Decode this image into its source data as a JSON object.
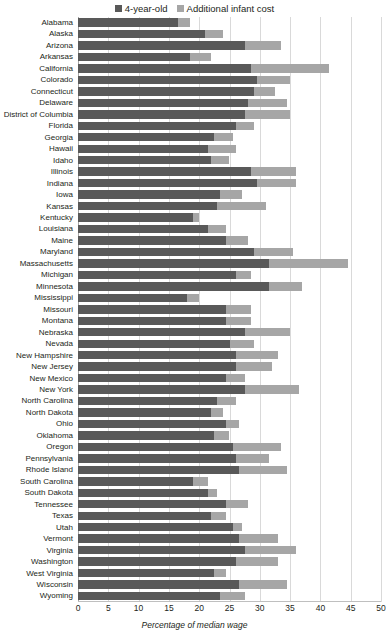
{
  "legend": {
    "items": [
      {
        "label": "4-year-old",
        "color": "#595959",
        "icon": "square-swatch-icon"
      },
      {
        "label": "Additional infant cost",
        "color": "#a6a6a6",
        "icon": "square-swatch-icon"
      }
    ]
  },
  "axis": {
    "xlabel": "Percentage of median wage",
    "ticks": [
      "0",
      "5",
      "10",
      "15",
      "20",
      "25",
      "30",
      "35",
      "40",
      "45",
      "50"
    ]
  },
  "chart_data": {
    "type": "bar",
    "orientation": "horizontal",
    "stacked": true,
    "title": "",
    "xlabel": "Percentage of median wage",
    "ylabel": "",
    "xlim": [
      0,
      50
    ],
    "xticks": [
      0,
      5,
      10,
      15,
      20,
      25,
      30,
      35,
      40,
      45,
      50
    ],
    "grid": "vertical",
    "legend_position": "top-center",
    "categories": [
      "Alabama",
      "Alaska",
      "Arizona",
      "Arkansas",
      "California",
      "Colorado",
      "Connecticut",
      "Delaware",
      "District of Columbia",
      "Florida",
      "Georgia",
      "Hawaii",
      "Idaho",
      "Illinois",
      "Indiana",
      "Iowa",
      "Kansas",
      "Kentucky",
      "Louisiana",
      "Maine",
      "Maryland",
      "Massachusetts",
      "Michigan",
      "Minnesota",
      "Mississippi",
      "Missouri",
      "Montana",
      "Nebraska",
      "Nevada",
      "New Hampshire",
      "New Jersey",
      "New Mexico",
      "New York",
      "North Carolina",
      "North Dakota",
      "Ohio",
      "Oklahoma",
      "Oregon",
      "Pennsylvania",
      "Rhode Island",
      "South Carolina",
      "South Dakota",
      "Tennessee",
      "Texas",
      "Utah",
      "Vermont",
      "Virginia",
      "Washington",
      "West Virginia",
      "Wisconsin",
      "Wyoming"
    ],
    "series": [
      {
        "name": "4-year-old",
        "color": "#595959",
        "values": [
          16.5,
          21.0,
          27.5,
          18.5,
          28.5,
          29.5,
          29.0,
          28.0,
          27.5,
          26.0,
          22.5,
          21.5,
          22.0,
          28.5,
          29.5,
          23.5,
          23.0,
          19.0,
          21.5,
          24.5,
          29.0,
          31.5,
          26.0,
          31.5,
          18.0,
          24.5,
          24.5,
          27.5,
          25.0,
          26.0,
          26.0,
          24.5,
          27.5,
          23.0,
          22.0,
          24.5,
          22.5,
          25.5,
          26.0,
          26.5,
          19.0,
          21.5,
          24.5,
          22.0,
          25.5,
          26.5,
          27.5,
          26.0,
          22.5,
          26.5,
          23.5
        ]
      },
      {
        "name": "Additional infant cost",
        "color": "#a6a6a6",
        "values": [
          2.0,
          3.0,
          6.0,
          3.5,
          13.0,
          5.5,
          3.5,
          6.5,
          7.5,
          3.0,
          3.0,
          4.5,
          3.0,
          7.5,
          6.5,
          3.5,
          8.0,
          1.0,
          3.0,
          3.5,
          6.5,
          13.0,
          2.5,
          5.5,
          2.0,
          4.0,
          4.0,
          7.5,
          4.0,
          7.0,
          6.0,
          3.0,
          9.0,
          3.0,
          2.0,
          2.0,
          2.5,
          8.0,
          5.5,
          8.0,
          2.5,
          1.5,
          3.5,
          2.5,
          1.5,
          6.5,
          8.5,
          7.0,
          2.0,
          8.0,
          4.0
        ]
      }
    ]
  }
}
